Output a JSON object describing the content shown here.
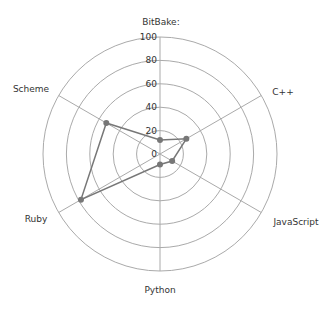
{
  "chart_data": {
    "type": "radar",
    "title": "",
    "categories": [
      "BitBake:",
      "C++",
      "JavaScript",
      "Python",
      "Ruby",
      "Scheme"
    ],
    "series": [
      {
        "name": "",
        "values": [
          12,
          26,
          12,
          9,
          78,
          53
        ]
      }
    ],
    "radial_ticks": [
      0,
      20,
      40,
      60,
      80,
      100
    ],
    "rlim": [
      0,
      100
    ],
    "grid": true,
    "legend": "none"
  },
  "style": {
    "grid_color": "#aaaaaa",
    "series_color": "#777777",
    "label_color": "#333333"
  }
}
